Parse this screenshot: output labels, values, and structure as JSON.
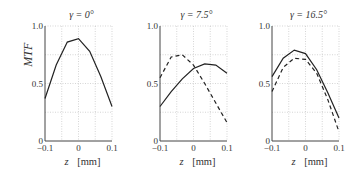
{
  "chart_data": [
    {
      "type": "line",
      "title": "γ = 0°",
      "xlabel": "z  [mm]",
      "ylabel": "MTF",
      "x": [
        -0.1,
        -0.0667,
        -0.0333,
        0,
        0.0333,
        0.0667,
        0.1
      ],
      "xticks": [
        "-0.1",
        "0",
        "0.1"
      ],
      "yticks": [
        "0",
        "0.5",
        "1.0"
      ],
      "xlim": [
        -0.1,
        0.1
      ],
      "ylim": [
        0,
        1.0
      ],
      "grid": true,
      "series": [
        {
          "name": "solid",
          "style": "solid",
          "values": [
            0.37,
            0.66,
            0.86,
            0.89,
            0.78,
            0.56,
            0.3
          ]
        }
      ]
    },
    {
      "type": "line",
      "title": "γ = 7.5°",
      "xlabel": "z  [mm]",
      "ylabel": "",
      "x": [
        -0.1,
        -0.0667,
        -0.0333,
        0,
        0.0333,
        0.0667,
        0.1
      ],
      "xticks": [
        "-0.1",
        "0",
        "0.1"
      ],
      "yticks": [
        "0",
        "0.5",
        "1.0"
      ],
      "xlim": [
        -0.1,
        0.1
      ],
      "ylim": [
        0,
        1.0
      ],
      "grid": true,
      "series": [
        {
          "name": "solid",
          "style": "solid",
          "values": [
            0.3,
            0.43,
            0.54,
            0.63,
            0.67,
            0.66,
            0.59
          ]
        },
        {
          "name": "dashed",
          "style": "dashed",
          "values": [
            0.55,
            0.73,
            0.75,
            0.66,
            0.5,
            0.33,
            0.16
          ]
        }
      ]
    },
    {
      "type": "line",
      "title": "γ = 16.5°",
      "xlabel": "z  [mm]",
      "ylabel": "",
      "x": [
        -0.1,
        -0.0667,
        -0.0333,
        0,
        0.0333,
        0.0667,
        0.1
      ],
      "xticks": [
        "-0.1",
        "0",
        "0.1"
      ],
      "yticks": [
        "0",
        "0.5",
        "1.0"
      ],
      "xlim": [
        -0.1,
        0.1
      ],
      "ylim": [
        0,
        1.0
      ],
      "grid": true,
      "series": [
        {
          "name": "solid",
          "style": "solid",
          "values": [
            0.56,
            0.72,
            0.79,
            0.76,
            0.62,
            0.42,
            0.2
          ]
        },
        {
          "name": "dashed",
          "style": "dashed",
          "values": [
            0.43,
            0.64,
            0.72,
            0.71,
            0.59,
            0.36,
            0.08
          ]
        }
      ]
    }
  ],
  "plots": [
    {
      "title": "γ = 0°"
    },
    {
      "title": "γ = 7.5°"
    },
    {
      "title": "γ = 16.5°"
    }
  ]
}
